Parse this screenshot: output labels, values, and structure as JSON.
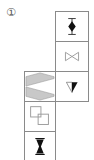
{
  "figure": {
    "label": "①",
    "border_color": "#8a8a8a",
    "cells": [
      {
        "id": "r1",
        "column": "right",
        "row": 1,
        "icon": "diamond-with-bar-icon",
        "description": "black diamond with vertical stem and caps"
      },
      {
        "id": "r2",
        "column": "right",
        "row": 2,
        "icon": "bowtie-outline-icon",
        "description": "outlined bowtie (two triangles meeting at center)"
      },
      {
        "id": "r3",
        "column": "right",
        "row": 3,
        "icon": "half-filled-down-triangle-icon",
        "description": "downward triangle, left half white, right half black"
      },
      {
        "id": "l3",
        "column": "left",
        "row": 3,
        "icon": "gray-chevron-icon",
        "description": "two gray chevron bands forming a left-pointing shape"
      },
      {
        "id": "l4",
        "column": "left",
        "row": 4,
        "icon": "overlapping-squares-icon",
        "description": "two overlapping outlined squares"
      },
      {
        "id": "l5",
        "column": "left",
        "row": 5,
        "icon": "hourglass-icon",
        "description": "black hourglass shape"
      }
    ],
    "colors": {
      "line": "#8a8a8a",
      "fill_black": "#111111",
      "fill_gray": "#c8c8c8",
      "outline_gray": "#9a9a9a"
    }
  }
}
